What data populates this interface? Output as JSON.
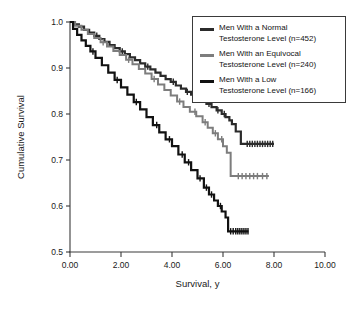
{
  "chart_data": {
    "type": "line",
    "title": "",
    "xlabel": "Survival, y",
    "ylabel": "Cumulative Survival",
    "xlim": [
      0,
      10
    ],
    "ylim": [
      0.5,
      1.0
    ],
    "xticks": [
      "0.00",
      "2.00",
      "4.00",
      "6.00",
      "8.00",
      "10.00"
    ],
    "xtick_values": [
      0,
      2,
      4,
      6,
      8,
      10
    ],
    "yticks": [
      "1.0",
      "0.9",
      "0.8",
      "0.7",
      "0.6",
      "0.5"
    ],
    "ytick_values": [
      1.0,
      0.9,
      0.8,
      0.7,
      0.6,
      0.5
    ],
    "grid": false,
    "legend_position": "top-right",
    "series": [
      {
        "name": "Men With a Normal Testosterone Level (n=452)",
        "label_line1": "Men With a Normal",
        "label_line2": "Testosterone Level (n=452)",
        "color": "#2b2b2b",
        "x": [
          0.0,
          0.15,
          0.35,
          0.55,
          0.75,
          0.95,
          1.15,
          1.35,
          1.55,
          1.75,
          1.95,
          2.15,
          2.35,
          2.55,
          2.75,
          2.95,
          3.15,
          3.35,
          3.55,
          3.75,
          3.95,
          4.15,
          4.35,
          4.55,
          4.75,
          4.95,
          5.15,
          5.35,
          5.55,
          5.75,
          5.95,
          6.1,
          6.25,
          6.35,
          6.5,
          6.7,
          8.0
        ],
        "y": [
          1.0,
          0.995,
          0.99,
          0.983,
          0.977,
          0.97,
          0.963,
          0.957,
          0.95,
          0.943,
          0.936,
          0.93,
          0.923,
          0.917,
          0.91,
          0.903,
          0.897,
          0.89,
          0.883,
          0.876,
          0.87,
          0.862,
          0.855,
          0.848,
          0.842,
          0.835,
          0.828,
          0.822,
          0.815,
          0.808,
          0.8,
          0.793,
          0.786,
          0.778,
          0.762,
          0.735,
          0.735
        ],
        "censor_x": [
          1.05,
          2.05,
          3.05,
          4.05,
          4.6,
          5.05,
          5.45,
          5.8,
          6.05,
          6.95,
          7.05,
          7.15,
          7.25,
          7.35,
          7.45,
          7.55,
          7.65,
          7.75,
          7.85,
          7.95
        ]
      },
      {
        "name": "Men With an Equivocal Testosterone Level (n=240)",
        "label_line1": "Men With an Equivocal",
        "label_line2": "Testosterone Level (n=240)",
        "color": "#7d7d7d",
        "x": [
          0.0,
          0.2,
          0.45,
          0.7,
          0.95,
          1.2,
          1.45,
          1.7,
          1.95,
          2.2,
          2.45,
          2.7,
          2.95,
          3.2,
          3.45,
          3.7,
          3.95,
          4.2,
          4.45,
          4.7,
          4.95,
          5.2,
          5.4,
          5.6,
          5.8,
          6.0,
          6.15,
          6.3,
          7.8
        ],
        "y": [
          1.0,
          0.992,
          0.983,
          0.974,
          0.965,
          0.956,
          0.947,
          0.937,
          0.928,
          0.918,
          0.908,
          0.898,
          0.888,
          0.876,
          0.864,
          0.852,
          0.84,
          0.827,
          0.815,
          0.805,
          0.795,
          0.782,
          0.77,
          0.758,
          0.745,
          0.73,
          0.716,
          0.665,
          0.665
        ],
        "censor_x": [
          1.3,
          2.3,
          3.3,
          4.3,
          4.9,
          5.3,
          5.7,
          5.95,
          6.6,
          6.75,
          6.9,
          7.05,
          7.2,
          7.35,
          7.55,
          7.72
        ]
      },
      {
        "name": "Men With a Low Testosterone Level (n=166)",
        "label_line1": "Men With a Low",
        "label_line2": "Testosterone Level (n=166)",
        "color": "#111111",
        "x": [
          0.0,
          0.12,
          0.28,
          0.45,
          0.62,
          0.8,
          1.0,
          1.25,
          1.5,
          1.75,
          2.0,
          2.25,
          2.5,
          2.75,
          3.0,
          3.25,
          3.5,
          3.75,
          4.0,
          4.25,
          4.5,
          4.75,
          5.0,
          5.25,
          5.45,
          5.65,
          5.8,
          5.95,
          6.1,
          6.2,
          7.0
        ],
        "y": [
          1.0,
          0.985,
          0.972,
          0.96,
          0.948,
          0.936,
          0.922,
          0.906,
          0.89,
          0.874,
          0.858,
          0.842,
          0.826,
          0.81,
          0.793,
          0.776,
          0.76,
          0.745,
          0.73,
          0.712,
          0.695,
          0.678,
          0.66,
          0.64,
          0.625,
          0.612,
          0.6,
          0.588,
          0.575,
          0.545,
          0.545
        ],
        "censor_x": [
          0.9,
          1.85,
          2.6,
          3.4,
          3.9,
          4.4,
          4.65,
          5.1,
          5.35,
          5.55,
          5.9,
          6.3,
          6.4,
          6.5,
          6.58,
          6.66,
          6.74,
          6.82,
          6.9,
          6.98
        ]
      }
    ]
  }
}
